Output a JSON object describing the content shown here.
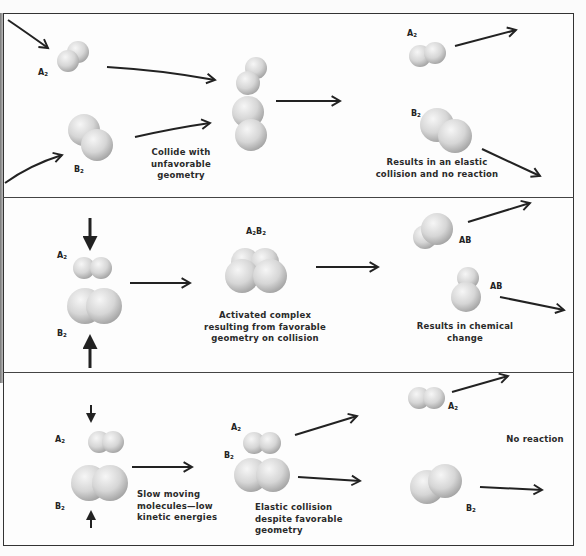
{
  "panels": [
    {
      "id": "unfavorable-geometry",
      "labels": {
        "a2": "A",
        "a2_sub": "2",
        "b2": "B",
        "b2_sub": "2",
        "a2_out": "A",
        "a2_out_sub": "2",
        "b2_out": "B",
        "b2_out_sub": "2"
      },
      "captions": {
        "collide": [
          "Collide with",
          "unfavorable geometry"
        ],
        "result": [
          "Results in an elastic",
          "collision and no reaction"
        ]
      }
    },
    {
      "id": "favorable-geometry",
      "labels": {
        "a2": "A",
        "a2_sub": "2",
        "b2": "B",
        "b2_sub": "2",
        "complex": "A",
        "complex_sub1": "2",
        "complex_mid": "B",
        "complex_sub2": "2",
        "ab1": "AB",
        "ab2": "AB"
      },
      "captions": {
        "complex": [
          "Activated complex",
          "resulting from favorable",
          "geometry on collision"
        ],
        "result": [
          "Results in chemical",
          "change"
        ]
      }
    },
    {
      "id": "low-kinetic-energy",
      "labels": {
        "a2": "A",
        "a2_sub": "2",
        "b2": "B",
        "b2_sub": "2",
        "a2_mid": "A",
        "a2_mid_sub": "2",
        "b2_mid": "B",
        "b2_mid_sub": "2",
        "a2_out": "A",
        "a2_out_sub": "2",
        "b2_out": "B",
        "b2_out_sub": "2"
      },
      "captions": {
        "slow": [
          "Slow moving",
          "molecules—low",
          "kinetic energies"
        ],
        "elastic": [
          "Elastic collision",
          "despite favorable",
          "geometry"
        ],
        "result": "No reaction"
      }
    }
  ],
  "colors": {
    "line": "#222222",
    "sphere_light": "#f4f4f4",
    "sphere_dark": "#9a9a9a",
    "frame": "#333333"
  }
}
